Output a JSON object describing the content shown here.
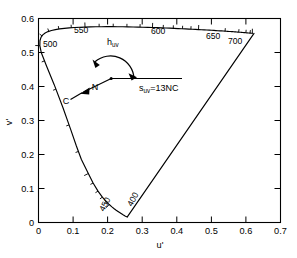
{
  "figure": {
    "name": "cie-1976-ucs-chromaticity-diagram",
    "x_axis_label": "u'",
    "y_axis_label": "v'"
  },
  "annotations": {
    "hue_angle_label": "h",
    "hue_angle_sub": "uv",
    "saturation_label": "s",
    "saturation_sub": "uv",
    "saturation_expr": "=13NC",
    "point_n": "N",
    "point_c": "C"
  },
  "chart_data": {
    "type": "line",
    "title": "",
    "xlabel": "u'",
    "ylabel": "v'",
    "xlim": [
      0,
      0.7
    ],
    "ylim": [
      0,
      0.6
    ],
    "grid": false,
    "legend": null,
    "xticks": [
      0,
      0.1,
      0.2,
      0.3,
      0.4,
      0.5,
      0.6,
      0.7
    ],
    "xticklabels": [
      "0",
      "0.1",
      "0.2",
      "0.3",
      "0.4",
      "0.5",
      "0.6",
      "0.7"
    ],
    "yticks": [
      0,
      0.1,
      0.2,
      0.3,
      0.4,
      0.5,
      0.6
    ],
    "yticklabels": [
      "0",
      "0.1",
      "0.2",
      "0.3",
      "0.4",
      "0.5",
      "0.6"
    ],
    "series": [
      {
        "name": "spectral locus",
        "comment": "CIE 1976 u'v' spectral locus, 380-700 nm",
        "points": [
          [
            0.2569,
            0.0165
          ],
          [
            0.2555,
            0.0169
          ],
          [
            0.2543,
            0.0173
          ],
          [
            0.2531,
            0.0178
          ],
          [
            0.2518,
            0.0184
          ],
          [
            0.2502,
            0.0192
          ],
          [
            0.2482,
            0.0204
          ],
          [
            0.2456,
            0.022
          ],
          [
            0.2425,
            0.024
          ],
          [
            0.2389,
            0.0264
          ],
          [
            0.2347,
            0.0292
          ],
          [
            0.23,
            0.0325
          ],
          [
            0.2247,
            0.0362
          ],
          [
            0.2189,
            0.0406
          ],
          [
            0.2123,
            0.0459
          ],
          [
            0.2046,
            0.0528
          ],
          [
            0.1956,
            0.0618
          ],
          [
            0.1847,
            0.0746
          ],
          [
            0.1721,
            0.0922
          ],
          [
            0.1579,
            0.116
          ],
          [
            0.1441,
            0.144
          ],
          [
            0.1241,
            0.1851
          ],
          [
            0.1096,
            0.2249
          ],
          [
            0.093,
            0.274
          ],
          [
            0.0703,
            0.3391
          ],
          [
            0.0454,
            0.4054
          ],
          [
            0.0235,
            0.4596
          ],
          [
            0.0082,
            0.4991
          ],
          [
            0.0039,
            0.5202
          ],
          [
            0.0042,
            0.5346
          ],
          [
            0.0072,
            0.5447
          ],
          [
            0.0123,
            0.5519
          ],
          [
            0.0192,
            0.5573
          ],
          [
            0.0276,
            0.5615
          ],
          [
            0.0375,
            0.5648
          ],
          [
            0.0488,
            0.5674
          ],
          [
            0.0612,
            0.5694
          ],
          [
            0.0747,
            0.5711
          ],
          [
            0.089,
            0.5724
          ],
          [
            0.1037,
            0.5734
          ],
          [
            0.1189,
            0.5742
          ],
          [
            0.1345,
            0.5748
          ],
          [
            0.1502,
            0.5753
          ],
          [
            0.166,
            0.5756
          ],
          [
            0.1817,
            0.5758
          ],
          [
            0.1974,
            0.5759
          ],
          [
            0.213,
            0.5759
          ],
          [
            0.2285,
            0.5758
          ],
          [
            0.2437,
            0.5757
          ],
          [
            0.2587,
            0.5754
          ],
          [
            0.2735,
            0.5751
          ],
          [
            0.288,
            0.5748
          ],
          [
            0.3022,
            0.5744
          ],
          [
            0.3161,
            0.574
          ],
          [
            0.3297,
            0.5735
          ],
          [
            0.3429,
            0.573
          ],
          [
            0.3558,
            0.5725
          ],
          [
            0.3683,
            0.572
          ],
          [
            0.3804,
            0.5715
          ],
          [
            0.3921,
            0.571
          ],
          [
            0.4035,
            0.5704
          ],
          [
            0.4144,
            0.5699
          ],
          [
            0.4249,
            0.5694
          ],
          [
            0.435,
            0.5689
          ],
          [
            0.4447,
            0.5684
          ],
          [
            0.4539,
            0.5679
          ],
          [
            0.4628,
            0.5674
          ],
          [
            0.4712,
            0.567
          ],
          [
            0.4792,
            0.5665
          ],
          [
            0.4868,
            0.5661
          ],
          [
            0.494,
            0.5657
          ],
          [
            0.5008,
            0.5653
          ],
          [
            0.5072,
            0.5649
          ],
          [
            0.5133,
            0.5645
          ],
          [
            0.519,
            0.5641
          ],
          [
            0.5244,
            0.5638
          ],
          [
            0.5295,
            0.5634
          ],
          [
            0.5343,
            0.5631
          ],
          [
            0.5389,
            0.5628
          ],
          [
            0.5432,
            0.5625
          ],
          [
            0.5473,
            0.5622
          ],
          [
            0.5512,
            0.5619
          ],
          [
            0.5549,
            0.5617
          ],
          [
            0.5584,
            0.5614
          ],
          [
            0.5617,
            0.5612
          ],
          [
            0.5648,
            0.5609
          ],
          [
            0.5678,
            0.5607
          ],
          [
            0.5706,
            0.5605
          ],
          [
            0.5733,
            0.5603
          ],
          [
            0.5758,
            0.5601
          ],
          [
            0.5782,
            0.5599
          ],
          [
            0.5805,
            0.5597
          ],
          [
            0.5827,
            0.5596
          ],
          [
            0.5847,
            0.5594
          ],
          [
            0.5867,
            0.5592
          ],
          [
            0.5885,
            0.5591
          ],
          [
            0.5903,
            0.5589
          ],
          [
            0.592,
            0.5588
          ],
          [
            0.5936,
            0.5586
          ],
          [
            0.5951,
            0.5585
          ],
          [
            0.5965,
            0.5584
          ],
          [
            0.5979,
            0.5583
          ],
          [
            0.5992,
            0.5581
          ],
          [
            0.6005,
            0.558
          ],
          [
            0.6017,
            0.5579
          ],
          [
            0.6029,
            0.5578
          ],
          [
            0.604,
            0.5577
          ],
          [
            0.605,
            0.5576
          ],
          [
            0.606,
            0.5575
          ],
          [
            0.607,
            0.5575
          ],
          [
            0.6079,
            0.5574
          ],
          [
            0.6088,
            0.5573
          ],
          [
            0.6096,
            0.5572
          ],
          [
            0.6104,
            0.5571
          ],
          [
            0.6112,
            0.5571
          ],
          [
            0.6119,
            0.557
          ],
          [
            0.6126,
            0.5569
          ],
          [
            0.6133,
            0.5569
          ],
          [
            0.6139,
            0.5568
          ],
          [
            0.6145,
            0.5568
          ],
          [
            0.6151,
            0.5567
          ],
          [
            0.6157,
            0.5567
          ],
          [
            0.6162,
            0.5566
          ],
          [
            0.6167,
            0.5566
          ],
          [
            0.6172,
            0.5565
          ],
          [
            0.6177,
            0.5565
          ],
          [
            0.6181,
            0.5564
          ],
          [
            0.6186,
            0.5564
          ]
        ]
      },
      {
        "name": "purple line",
        "comment": "straight line from 700nm extreme to 380nm extreme",
        "points": [
          [
            0.6234,
            0.5561
          ],
          [
            0.2569,
            0.0165
          ]
        ]
      }
    ],
    "wavelength_markers": [
      {
        "nm": 400,
        "u": 0.179,
        "v": 0.0197,
        "label": "400",
        "labeled": true
      },
      {
        "nm": 450,
        "u": 0.1266,
        "v": 0.1531,
        "label": "450",
        "labeled": true
      },
      {
        "nm": 500,
        "u": 0.0035,
        "v": 0.5131,
        "label": "500",
        "labeled": true
      },
      {
        "nm": 550,
        "u": 0.1373,
        "v": 0.5751,
        "label": "550",
        "labeled": true
      },
      {
        "nm": 600,
        "u": 0.3289,
        "v": 0.5735,
        "label": "600",
        "labeled": true
      },
      {
        "nm": 650,
        "u": 0.4611,
        "v": 0.5675,
        "label": "650",
        "labeled": true
      },
      {
        "nm": 700,
        "u": 0.6234,
        "v": 0.5561,
        "label": "700",
        "labeled": true
      }
    ],
    "annotation_geometry": {
      "point_N": [
        0.21,
        0.469
      ],
      "point_C": [
        0.127,
        0.4105
      ],
      "horizontal_ray_end": [
        0.415,
        0.469
      ],
      "arrow_to_C": [
        0.133,
        0.4145
      ],
      "arc_start": [
        0.308,
        0.469
      ],
      "arc_end": [
        0.162,
        0.438
      ]
    }
  }
}
